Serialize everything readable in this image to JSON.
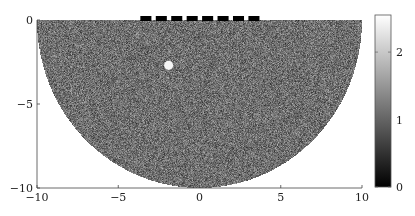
{
  "chart_data": {
    "type": "heatmap",
    "title": "",
    "xlabel": "",
    "ylabel": "",
    "xlim": [
      -10,
      10
    ],
    "ylim": [
      -10,
      0
    ],
    "xticks": [
      -10,
      -5,
      0,
      5,
      10
    ],
    "xtick_labels": [
      "−10",
      "−5",
      "0",
      "5",
      "10"
    ],
    "yticks": [
      0,
      -5,
      -10
    ],
    "ytick_labels": [
      "0",
      "−5",
      "−10"
    ],
    "grid": false,
    "colormap": "gray",
    "field": {
      "shape": "half-disk",
      "center": [
        0,
        0
      ],
      "radius": 10,
      "description": "random noise values",
      "value_range_typical": [
        0.5,
        1.7
      ]
    },
    "inclusion": {
      "center": [
        -1.9,
        -2.7
      ],
      "radius": 0.28,
      "value": 2.5
    },
    "electrodes": {
      "count": 8,
      "x_centers": [
        -3.3,
        -2.35,
        -1.4,
        -0.45,
        0.5,
        1.45,
        2.4,
        3.35
      ],
      "width": 0.68,
      "y": 0,
      "value": 0
    },
    "colorbar": {
      "range": [
        0,
        2.55
      ],
      "ticks": [
        0,
        1,
        2
      ],
      "tick_labels": [
        "0",
        "1",
        "2"
      ],
      "placement": "right"
    }
  }
}
